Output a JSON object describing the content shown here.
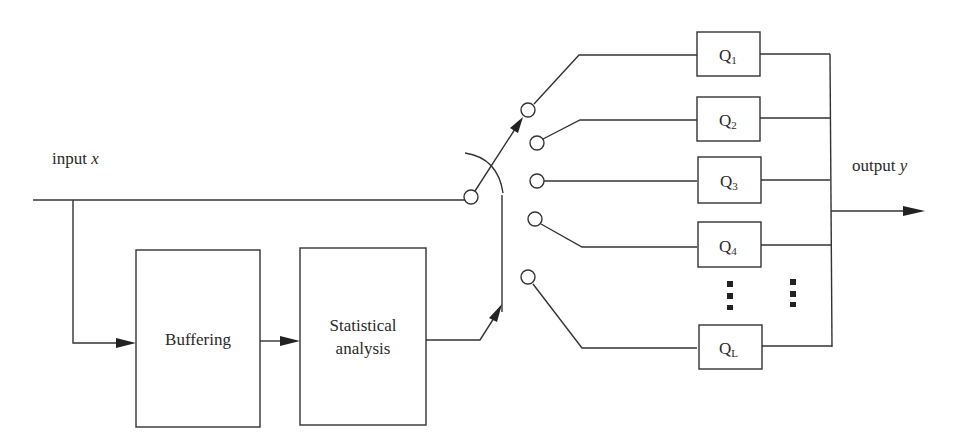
{
  "diagram": {
    "input_label": "input ",
    "input_var": "x",
    "output_label": "output ",
    "output_var": "y",
    "blocks": {
      "buffering": "Buffering",
      "statistical_line1": "Statistical",
      "statistical_line2": "analysis"
    },
    "quantizers": [
      {
        "base": "Q",
        "sub": "1"
      },
      {
        "base": "Q",
        "sub": "2"
      },
      {
        "base": "Q",
        "sub": "3"
      },
      {
        "base": "Q",
        "sub": "4"
      },
      {
        "base": "Q",
        "sub": "L"
      }
    ],
    "ellipsis": "⋮",
    "colors": {
      "line": "#333333",
      "background": "#ffffff"
    }
  }
}
